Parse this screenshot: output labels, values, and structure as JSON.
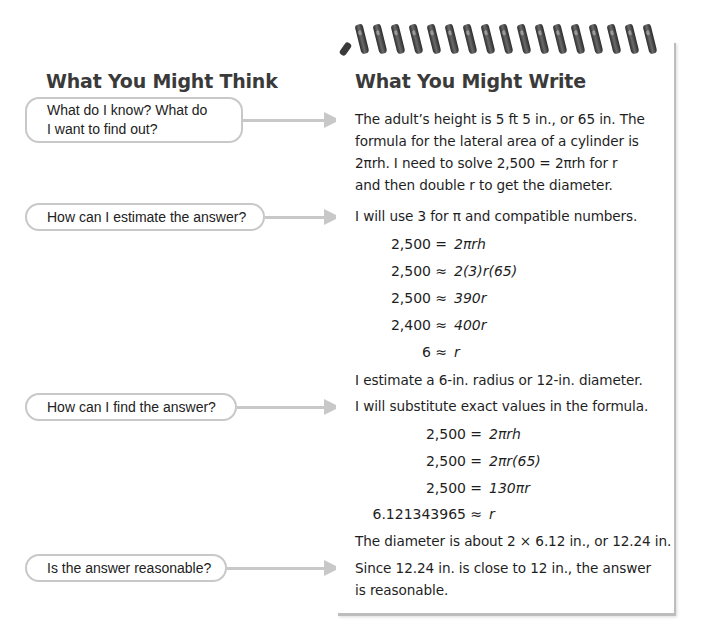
{
  "left_column": {
    "heading": "What You Might Think",
    "questions": [
      {
        "line1": "What do I know? What do",
        "line2": "I want to find out?"
      },
      {
        "line1": "How can I estimate the answer?"
      },
      {
        "line1": "How can I find the answer?"
      },
      {
        "line1": "Is the answer reasonable?"
      }
    ]
  },
  "notepad": {
    "heading": "What You Might Write",
    "coil_count": 17,
    "step1": {
      "lines": [
        "The adult’s height is 5 ft 5 in., or 65 in. The",
        "formula for the lateral area of a cylinder is",
        "2πrh. I need to solve 2,500 = 2πrh for r",
        "and then double r to get the diameter."
      ]
    },
    "step2": {
      "intro": "I will use 3 for π and compatible numbers.",
      "equations": [
        {
          "lhs": "2,500",
          "op": "=",
          "rhs": "2πrh"
        },
        {
          "lhs": "2,500",
          "op": "≈",
          "rhs": "2(3)r(65)"
        },
        {
          "lhs": "2,500",
          "op": "≈",
          "rhs": "390r"
        },
        {
          "lhs": "2,400",
          "op": "≈",
          "rhs": "400r"
        },
        {
          "lhs": "6",
          "op": "≈",
          "rhs": "r"
        }
      ],
      "conclusion": "I estimate a 6-in. radius or 12-in. diameter."
    },
    "step3": {
      "intro": "I will substitute exact values in the formula.",
      "equations": [
        {
          "lhs": "2,500",
          "op": "=",
          "rhs": "2πrh"
        },
        {
          "lhs": "2,500",
          "op": "=",
          "rhs": "2πr(65)"
        },
        {
          "lhs": "2,500",
          "op": "=",
          "rhs": "130πr"
        },
        {
          "lhs": "6.121343965",
          "op": "≈",
          "rhs": "r"
        }
      ],
      "conclusion": "The diameter is about 2 × 6.12 in., or 12.24 in."
    },
    "step4": {
      "lines": [
        "Since 12.24 in. is close to 12 in., the answer",
        "is reasonable."
      ]
    }
  },
  "colors": {
    "box_border": "#c8c8c8",
    "arrow": "#c8c8c8",
    "heading_text": "#3a3a3a",
    "body_text": "#1e1e1e",
    "coil": "#3a3a3a",
    "notepad_shadow": "#bdbdbd"
  }
}
